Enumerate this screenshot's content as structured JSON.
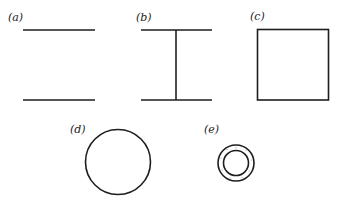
{
  "figure": {
    "panels": [
      {
        "id": "a",
        "label": "(a)",
        "shape": "two-parallel-lines"
      },
      {
        "id": "b",
        "label": "(b)",
        "shape": "I-beam"
      },
      {
        "id": "c",
        "label": "(c)",
        "shape": "square"
      },
      {
        "id": "d",
        "label": "(d)",
        "shape": "circle"
      },
      {
        "id": "e",
        "label": "(e)",
        "shape": "annulus"
      }
    ]
  },
  "colors": {
    "stroke": "#1e1e1e",
    "background": "#ffffff"
  }
}
